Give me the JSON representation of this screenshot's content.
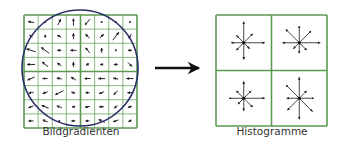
{
  "diagram": {
    "left_panel": {
      "label": "Bildgradienten",
      "grid": {
        "x": 24,
        "y": 15,
        "size": 113,
        "cells": 8
      },
      "circle": {
        "cx": 80,
        "cy": 68,
        "r": 58
      },
      "gradient_arrows": [
        [
          [
            -6,
            -1
          ],
          [
            0,
            0
          ],
          [
            3,
            -6
          ],
          [
            0,
            -7
          ],
          [
            -5,
            6
          ],
          [
            0,
            0
          ],
          [
            0,
            0
          ],
          [
            0,
            0
          ]
        ],
        [
          [
            -3,
            -2
          ],
          [
            0,
            -3
          ],
          [
            -4,
            -2
          ],
          [
            0,
            -6
          ],
          [
            -4,
            -4
          ],
          [
            4,
            -4
          ],
          [
            6,
            -8
          ],
          [
            -3,
            4
          ]
        ],
        [
          [
            -9,
            -3
          ],
          [
            -8,
            -6
          ],
          [
            -4,
            0
          ],
          [
            -6,
            0
          ],
          [
            -4,
            -5
          ],
          [
            0,
            -5
          ],
          [
            0,
            0
          ],
          [
            -4,
            0
          ]
        ],
        [
          [
            -8,
            0
          ],
          [
            -6,
            -5
          ],
          [
            -4,
            -3
          ],
          [
            0,
            -5
          ],
          [
            -3,
            2
          ],
          [
            -3,
            0
          ],
          [
            -4,
            0
          ],
          [
            4,
            4
          ]
        ],
        [
          [
            -7,
            3
          ],
          [
            -5,
            0
          ],
          [
            -5,
            -1
          ],
          [
            -5,
            -3
          ],
          [
            -6,
            0
          ],
          [
            -7,
            0
          ],
          [
            -5,
            -1
          ],
          [
            -7,
            0
          ]
        ],
        [
          [
            -5,
            1
          ],
          [
            -5,
            2
          ],
          [
            -8,
            4
          ],
          [
            -4,
            -1
          ],
          [
            -4,
            0
          ],
          [
            -5,
            2
          ],
          [
            -4,
            4
          ],
          [
            -5,
            0
          ]
        ],
        [
          [
            -5,
            2
          ],
          [
            -7,
            -3
          ],
          [
            -5,
            -2
          ],
          [
            -3,
            0
          ],
          [
            -5,
            1
          ],
          [
            -5,
            0
          ],
          [
            -3,
            3
          ],
          [
            -4,
            1
          ]
        ],
        [
          [
            -5,
            0
          ],
          [
            -5,
            -2
          ],
          [
            0,
            0
          ],
          [
            -4,
            0
          ],
          [
            -4,
            0
          ],
          [
            -6,
            -3
          ],
          [
            -5,
            2
          ],
          [
            -3,
            1
          ]
        ]
      ]
    },
    "transition_arrow": {
      "x1": 155,
      "x2": 203,
      "y": 68
    },
    "right_panel": {
      "label": "Histogramme",
      "grid": {
        "x": 216,
        "y": 15,
        "size": 111,
        "cells": 2
      },
      "histograms": [
        [
          10,
          6,
          10,
          4,
          8,
          5,
          6,
          5
        ],
        [
          8,
          8,
          10,
          5,
          5,
          4,
          8,
          9
        ],
        [
          8,
          5,
          10,
          6,
          6,
          4,
          7,
          5
        ],
        [
          10,
          5,
          7,
          9,
          10,
          8,
          6,
          9
        ]
      ]
    },
    "colors": {
      "grid": "#5a9a4e",
      "circle": "#2a2f6a",
      "arrow": "#111111",
      "label": "#333333"
    }
  }
}
